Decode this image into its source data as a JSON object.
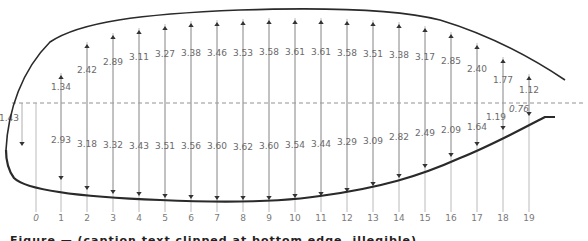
{
  "figure": {
    "colors": {
      "outline": "#2a2a2a",
      "arrow": "#9a9a9a",
      "arrowhead": "#333333",
      "text": "#6a6a6a",
      "chord_line": "#777777"
    },
    "stations": [
      "0",
      "1",
      "2",
      "3",
      "4",
      "5",
      "6",
      "7",
      "8",
      "9",
      "10",
      "11",
      "12",
      "13",
      "14",
      "15",
      "16",
      "17",
      "18",
      "19"
    ],
    "upper_values": [
      null,
      "1.34",
      "2.42",
      "2.89",
      "3.11",
      "3.27",
      "3.38",
      "3.46",
      "3.53",
      "3.58",
      "3.61",
      "3.61",
      "3.58",
      "3.51",
      "3.38",
      "3.17",
      "2.85",
      "2.40",
      "1.77",
      "1.12"
    ],
    "lower_values": [
      "1.43",
      "2.93",
      "3.18",
      "3.32",
      "3.43",
      "3.51",
      "3.56",
      "3.60",
      "3.62",
      "3.60",
      "3.54",
      "3.44",
      "3.29",
      "3.09",
      "2.82",
      "2.49",
      "2.09",
      "1.64",
      "1.19",
      "0.76"
    ],
    "caption_clipped": "Figure — (caption text clipped at bottom edge, illegible)"
  },
  "chart_data": {
    "type": "diagram",
    "title": "",
    "xlabel": "Chordwise station",
    "x": [
      0,
      1,
      2,
      3,
      4,
      5,
      6,
      7,
      8,
      9,
      10,
      11,
      12,
      13,
      14,
      15,
      16,
      17,
      18,
      19
    ],
    "series": [
      {
        "name": "Upper surface (arrows up)",
        "values": [
          null,
          1.34,
          2.42,
          2.89,
          3.11,
          3.27,
          3.38,
          3.46,
          3.53,
          3.58,
          3.61,
          3.61,
          3.58,
          3.51,
          3.38,
          3.17,
          2.85,
          2.4,
          1.77,
          1.12
        ]
      },
      {
        "name": "Lower surface (arrows down)",
        "values": [
          1.43,
          2.93,
          3.18,
          3.32,
          3.43,
          3.51,
          3.56,
          3.6,
          3.62,
          3.6,
          3.54,
          3.44,
          3.29,
          3.09,
          2.82,
          2.49,
          2.09,
          1.64,
          1.19,
          0.76
        ]
      }
    ],
    "annotations": [
      "dashed horizontal chord/reference line"
    ],
    "grid": false
  }
}
